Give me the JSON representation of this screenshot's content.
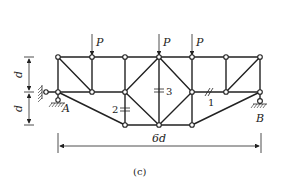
{
  "figure": {
    "caption": "(c)",
    "loads": [
      {
        "label": "P",
        "x": 92
      },
      {
        "label": "P",
        "x": 159
      },
      {
        "label": "P",
        "x": 192
      }
    ],
    "supports": [
      {
        "label": "A",
        "type": "pin+horizontal-link"
      },
      {
        "label": "B",
        "type": "roller"
      }
    ],
    "members": [
      {
        "label": "1"
      },
      {
        "label": "2"
      },
      {
        "label": "3"
      }
    ],
    "dimensions": {
      "height_upper": "d",
      "height_lower": "d",
      "span": "6d"
    }
  }
}
